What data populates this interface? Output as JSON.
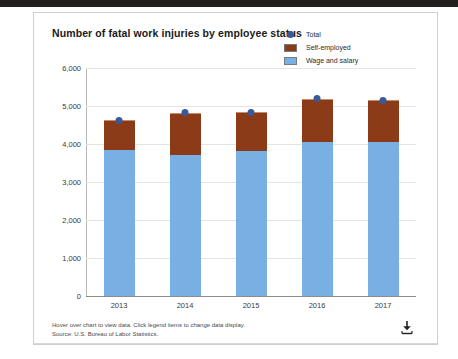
{
  "window": {
    "chrome_color": "#231f1c"
  },
  "header": {
    "title": "Number of fatal work injuries by employee status"
  },
  "legend": {
    "position": "top-right",
    "items": [
      {
        "label": "Total",
        "color": "#3b5998",
        "marker": "dot",
        "icon": "legend-dot-icon"
      },
      {
        "label": "Self-employed",
        "color": "#8c3b19",
        "marker": "box",
        "icon": "legend-swatch-icon"
      },
      {
        "label": "Wage and salary",
        "color": "#79b0e4",
        "marker": "box",
        "icon": "legend-swatch-icon"
      }
    ]
  },
  "footer": {
    "note": "Hover over chart to view data. Click legend items to change data display.",
    "source": "Source: U.S. Bureau of Labor Statistics.",
    "download_icon": "download-icon"
  },
  "chart_data": {
    "type": "bar",
    "title": "Number of fatal work injuries by employee status",
    "xlabel": "",
    "ylabel": "",
    "categories": [
      "2013",
      "2014",
      "2015",
      "2016",
      "2017"
    ],
    "ylim": [
      0,
      6000
    ],
    "yticks": [
      0,
      1000,
      2000,
      3000,
      4000,
      5000,
      6000
    ],
    "ytick_labels": [
      "0",
      "1,000",
      "2,000",
      "3,000",
      "4,000",
      "5,000",
      "6,000"
    ],
    "grid": true,
    "stacked": true,
    "legend_position": "top-right",
    "series": [
      {
        "name": "Wage and salary",
        "color": "#79b0e4",
        "type": "bar",
        "values": [
          3860,
          3730,
          3840,
          4090,
          4090
        ]
      },
      {
        "name": "Self-employed",
        "color": "#8c3b19",
        "type": "bar",
        "values": [
          770,
          1090,
          1000,
          1100,
          1060
        ]
      },
      {
        "name": "Total",
        "color": "#3b5998",
        "type": "point",
        "values": [
          4630,
          4820,
          4840,
          5190,
          5150
        ]
      }
    ]
  }
}
